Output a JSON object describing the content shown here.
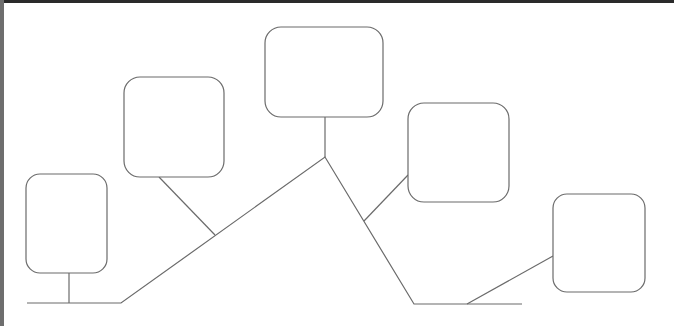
{
  "diagram": {
    "type": "tree-mountain",
    "stroke_color": "#6b6b6b",
    "frame": {
      "top_bar_color": "#2a2a2a",
      "left_bar_color": "#6e6e6e"
    },
    "nodes": [
      {
        "id": "box-1",
        "label": "",
        "x": 26,
        "y": 174,
        "w": 81,
        "h": 99,
        "r": 14
      },
      {
        "id": "box-2",
        "label": "",
        "x": 124,
        "y": 77,
        "w": 100,
        "h": 100,
        "r": 16
      },
      {
        "id": "box-3",
        "label": "",
        "x": 265,
        "y": 27,
        "w": 118,
        "h": 90,
        "r": 16
      },
      {
        "id": "box-4",
        "label": "",
        "x": 408,
        "y": 103,
        "w": 101,
        "h": 99,
        "r": 16
      },
      {
        "id": "box-5",
        "label": "",
        "x": 553,
        "y": 194,
        "w": 92,
        "h": 98,
        "r": 14
      }
    ],
    "trunk": {
      "points": "27,303 121,303 325,157 414,304 522,304"
    },
    "connectors": [
      {
        "id": "conn-1",
        "x1": 69,
        "y1": 273,
        "x2": 69,
        "y2": 303
      },
      {
        "id": "conn-2",
        "x1": 159,
        "y1": 177,
        "x2": 215,
        "y2": 235
      },
      {
        "id": "conn-3",
        "x1": 325,
        "y1": 117,
        "x2": 325,
        "y2": 157
      },
      {
        "id": "conn-4",
        "x1": 408,
        "y1": 175,
        "x2": 364,
        "y2": 221
      },
      {
        "id": "conn-5",
        "x1": 553,
        "y1": 256,
        "x2": 467,
        "y2": 304
      }
    ]
  }
}
